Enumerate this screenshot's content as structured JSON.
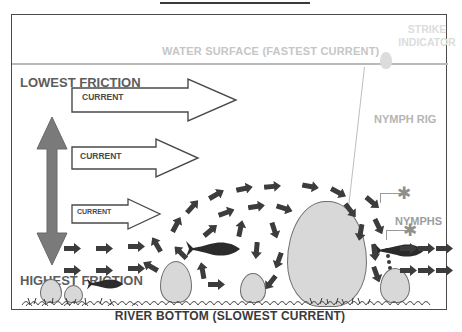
{
  "diagram": {
    "title_rule": "",
    "labels": {
      "water_surface": "WATER SURFACE  (FASTEST CURRENT)",
      "river_bottom": "RIVER BOTTOM (SLOWEST CURRENT)",
      "strike_indicator": "STRIKE INDICATOR",
      "nymph_rig": "NYMPH RIG",
      "nymphs": "NYMPHS",
      "lowest_friction": "LOWEST FRICTION",
      "highest_friction": "HIGHEST FRICTION"
    },
    "current_arrows": [
      {
        "label": "CURRENT",
        "size": "large"
      },
      {
        "label": "CURRENT",
        "size": "medium"
      },
      {
        "label": "CURRENT",
        "size": "small"
      }
    ],
    "colors": {
      "frame_border": "#4a4a4a",
      "surface_text": "#c6c6c6",
      "surface_line": "#b9b9b9",
      "strike_text": "#dcdcdc",
      "nymph_rig_text": "#b5b5b5",
      "nymphs_text": "#9d9d9d",
      "friction_text": "#5d5d5d",
      "friction_arrow": "#7a7a7a",
      "current_outline": "#4a4a4a",
      "turbulence_arrow": "#3c3c3c",
      "rock_fill": "#d8d8d8",
      "rock_stroke": "#6e6e6e",
      "fish": "#2b2b2b",
      "bottom_text": "#3a3a3a"
    },
    "icons": {
      "bobber": "strike-indicator-bobber",
      "nymph": "nymph-fly-icon",
      "fish": "trout-silhouette-icon",
      "boulder": "boulder-icon",
      "gravel": "gravel-bed-icon",
      "double_arrow": "friction-gradient-double-arrow"
    },
    "counts": {
      "fish": 3,
      "nymphs": 2,
      "rocks": 3
    }
  }
}
